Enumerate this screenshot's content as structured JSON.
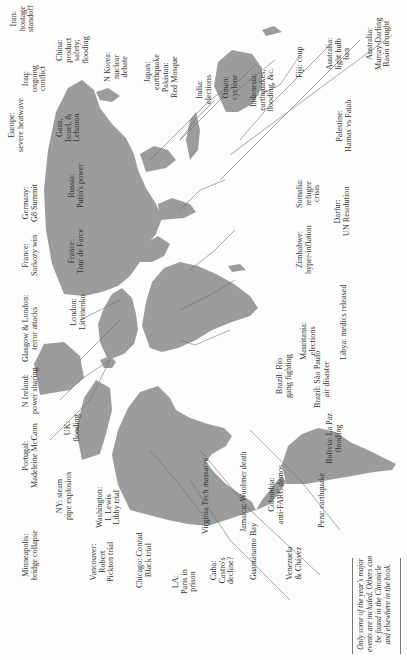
{
  "page": {
    "header_title": "Chronicle World Events of 2007",
    "orientation": "map rotated 90 degrees; north to the left",
    "footnote": "Only some of the year's major\nevents are included. Others can\nbe found in the Chronicle\nand elsewhere in the book."
  },
  "labels": {
    "iran": "Iran:\nhostage\nstandoff",
    "china": "China:\nproduct\nsafety;\nflooding",
    "nkorea": "N Korea:\nnuclear\ndebate",
    "japan": "Japan:\nearthquake",
    "pakistan": "Pakistan:\nRed Mosque",
    "india": "India:\nelections",
    "oman": "Oman:\ncyclone",
    "indonesia": "Indonesia:\nearthquakes,\nflooding, &c.",
    "fiji": "Fiji: coup",
    "aus_bulb": "Australia:\nlight bulb\nban",
    "aus_drought": "Australia:\nMurray-Darling\nBasin drought",
    "iraq": "Iraq:\nongoing\nconflict",
    "gaza": "Gaza,\nIsrael, &\nLebanon",
    "europe": "Europe:\nsevere heatwave",
    "russia": "Russia:\nPutin's power",
    "germany": "Germany:\nG8 Summit",
    "france_tour": "France:\nTour de Farce",
    "france_sarkozy": "France:\nSarkozy win",
    "london": "London:\nLitvinenko",
    "glasgow": "Glasgow & London:\nterror attacks",
    "nireland": "N Ireland:\npower sharing",
    "uk": "UK:\nflooding",
    "portugal": "Portugal:\nMadeleine McCann",
    "ny": "NY: steam\npipe explosion",
    "washington": "Washington:\nI. Lewis\nLibby trial",
    "minneapolis": "Minneapolis:\nbridge collapse",
    "vancouver": "Vancouver:\nRobert\nPickton trial",
    "chicago": "Chicago: Conrad\nBlack trial",
    "la": "LA:\nParis in\nprison",
    "virginia": "Virginia Tech massacre",
    "cuba": "Cuba:\nCastro's\ndecline?",
    "jamaica": "Jamaica: Woolmer death",
    "guantanamo": "Guantánamo Bay",
    "colombia": "Colombia:\nanti-FARC demos",
    "venezuela": "Venezuela\n& Chávez",
    "peru": "Peru: earthquake",
    "bolivia": "Bolivia: La Paz\nflooding",
    "brazil_sp": "Brazil: São Paulo\nair disaster",
    "brazil_rio": "Brazil: Rio\ngang fighting",
    "mauritania": "Mauritania:\nelections",
    "libya": "Libya: medics released",
    "zimbabwe": "Zimbabwe:\nhyper-inflation",
    "darfur": "Darfur:\nUN Resolution",
    "somalia": "Somalia:\nrefugee\ncrisis",
    "palestine": "Palestine:\nHamas vs Fatah"
  },
  "colors": {
    "land": "#9c9c9c",
    "leader_lines": "#6f6f6f",
    "text": "#333333",
    "background": "#fdfdfd"
  }
}
